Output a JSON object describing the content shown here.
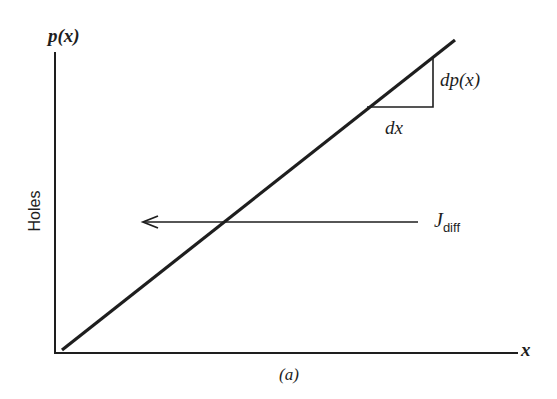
{
  "figure": {
    "y_axis_label": "p(x)",
    "y_axis_title": "Holes",
    "x_axis_label": "x",
    "caption": "(a)",
    "slope_dy_label": "dp(x)",
    "slope_dx_label": "dx",
    "current_label_main": "J",
    "current_label_sub": "diff",
    "colors": {
      "ink": "#1e1e1e",
      "background": "#ffffff"
    },
    "elements": {
      "y_axis": {
        "x": 55,
        "y_top": 52,
        "y_bottom": 353
      },
      "x_axis": {
        "y": 353,
        "x_left": 55,
        "x_right": 518
      },
      "concentration_line": {
        "x1": 62,
        "y1": 350,
        "x2": 455,
        "y2": 40
      },
      "slope_triangle": {
        "corner_x": 433,
        "corner_y": 107,
        "left_x": 367,
        "top_y": 57
      },
      "diffusion_arrow": {
        "y": 222,
        "x_start": 418,
        "x_end": 142,
        "direction": "left"
      }
    }
  }
}
